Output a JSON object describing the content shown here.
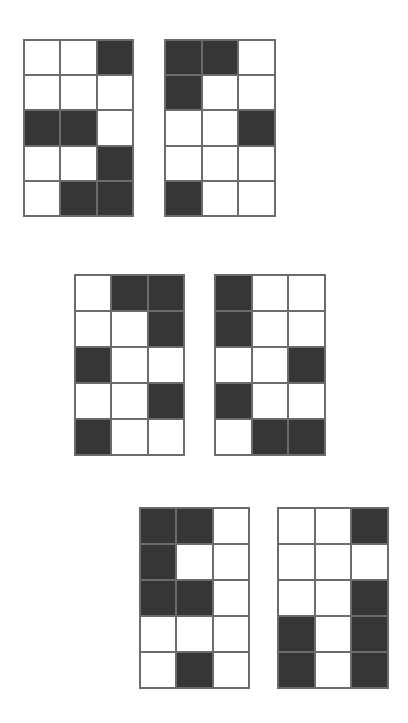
{
  "canvas": {
    "width": 408,
    "height": 723,
    "background_color": "#ffffff"
  },
  "style": {
    "fill_color": "#363636",
    "empty_color": "#ffffff",
    "grid_line_color": "#6b6b6b",
    "grid_line_width": 2
  },
  "figures": [
    {
      "id": "figure-1",
      "position": "top-left",
      "rows": 5,
      "cols": 3,
      "filled_count": 7,
      "cells": [
        [
          0,
          0,
          1
        ],
        [
          0,
          0,
          0
        ],
        [
          1,
          1,
          0
        ],
        [
          0,
          0,
          1
        ],
        [
          0,
          1,
          1
        ]
      ]
    },
    {
      "id": "figure-2",
      "position": "top-right",
      "rows": 5,
      "cols": 3,
      "filled_count": 5,
      "cells": [
        [
          1,
          1,
          0
        ],
        [
          1,
          0,
          0
        ],
        [
          0,
          0,
          1
        ],
        [
          0,
          0,
          0
        ],
        [
          1,
          0,
          0
        ]
      ]
    },
    {
      "id": "figure-3",
      "position": "middle-left",
      "rows": 5,
      "cols": 3,
      "filled_count": 6,
      "cells": [
        [
          0,
          1,
          1
        ],
        [
          0,
          0,
          1
        ],
        [
          1,
          0,
          0
        ],
        [
          0,
          0,
          1
        ],
        [
          1,
          0,
          0
        ]
      ]
    },
    {
      "id": "figure-4",
      "position": "middle-right",
      "rows": 5,
      "cols": 3,
      "filled_count": 6,
      "cells": [
        [
          1,
          0,
          0
        ],
        [
          1,
          0,
          0
        ],
        [
          0,
          0,
          1
        ],
        [
          1,
          0,
          0
        ],
        [
          0,
          1,
          1
        ]
      ]
    },
    {
      "id": "figure-5",
      "position": "bottom-left",
      "rows": 5,
      "cols": 3,
      "filled_count": 6,
      "cells": [
        [
          1,
          1,
          0
        ],
        [
          1,
          0,
          0
        ],
        [
          1,
          1,
          0
        ],
        [
          0,
          0,
          0
        ],
        [
          0,
          1,
          0
        ]
      ]
    },
    {
      "id": "figure-6",
      "position": "bottom-right",
      "rows": 5,
      "cols": 3,
      "filled_count": 7,
      "cells": [
        [
          0,
          0,
          1
        ],
        [
          0,
          0,
          0
        ],
        [
          0,
          0,
          1
        ],
        [
          1,
          0,
          1
        ],
        [
          1,
          0,
          1
        ]
      ]
    }
  ]
}
